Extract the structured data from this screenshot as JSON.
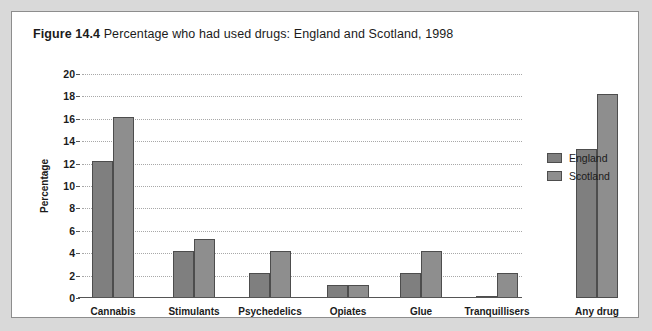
{
  "figure": {
    "label": "Figure 14.4",
    "title_text": "Percentage who had used drugs: England and Scotland, 1998"
  },
  "legend": {
    "position": "right",
    "entries": [
      {
        "name": "England",
        "color": "#7f7f7f"
      },
      {
        "name": "Scotland",
        "color": "#8e8e8e"
      }
    ]
  },
  "chart_data": {
    "type": "bar",
    "title": "Figure 14.4 Percentage who had used drugs: England and Scotland, 1998",
    "xlabel": "",
    "ylabel": "Percentage",
    "ylim": [
      0,
      20
    ],
    "yticks": [
      0,
      2,
      4,
      6,
      8,
      10,
      12,
      14,
      16,
      18,
      20
    ],
    "ytick_labels": [
      "0",
      "2",
      "4",
      "6",
      "8",
      "10",
      "12",
      "14",
      "16",
      "18",
      "20"
    ],
    "grid": true,
    "legend_position": "right",
    "categories": [
      "Cannabis",
      "Stimulants",
      "Psychedelics",
      "Opiates",
      "Glue",
      "Tranquillisers",
      "Any drug"
    ],
    "series": [
      {
        "name": "England",
        "color": "#7f7f7f",
        "values": [
          12.2,
          4.2,
          2.2,
          1.2,
          2.2,
          0.1,
          13.3
        ]
      },
      {
        "name": "Scotland",
        "color": "#8e8e8e",
        "values": [
          16.2,
          5.3,
          4.2,
          1.2,
          4.2,
          2.2,
          18.2
        ]
      }
    ]
  }
}
